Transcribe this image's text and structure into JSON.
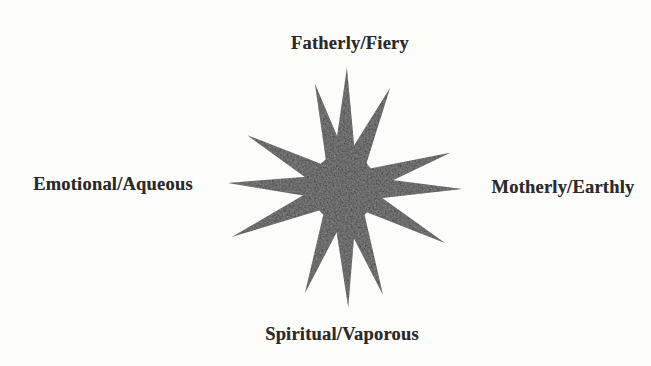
{
  "diagram": {
    "background": "#fcfcfb",
    "text_color": "#2d2b29",
    "labels": {
      "top": "Fatherly/Fiery",
      "right": "Motherly/Earthly",
      "bottom": "Spiritual/Vaporous",
      "left": "Emotional/Aqueous"
    },
    "star": {
      "fill": "#3d3d3d",
      "center": {
        "x": 344,
        "y": 188
      },
      "core": {
        "rx": 32,
        "ry": 35
      },
      "spike_base_offset": 15,
      "spike_base_half_width": 16,
      "rays": [
        {
          "angle": 88.6,
          "length": 120
        },
        {
          "angle": 65.3,
          "length": 110
        },
        {
          "angle": 18.3,
          "length": 112
        },
        {
          "angle": -0.5,
          "length": 118
        },
        {
          "angle": -28.6,
          "length": 115
        },
        {
          "angle": -70.0,
          "length": 114
        },
        {
          "angle": -88.0,
          "length": 119
        },
        {
          "angle": -110.4,
          "length": 112
        },
        {
          "angle": -156.4,
          "length": 122
        },
        {
          "angle": 177.5,
          "length": 116
        },
        {
          "angle": 151.4,
          "length": 110
        },
        {
          "angle": 105.6,
          "length": 108
        }
      ]
    }
  }
}
